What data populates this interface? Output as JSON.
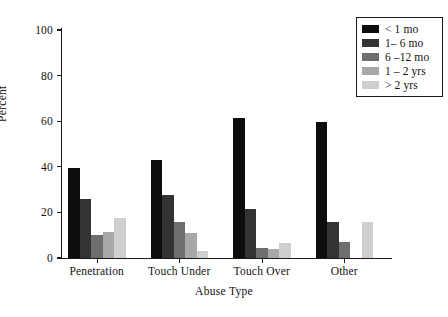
{
  "chart_data": {
    "type": "bar",
    "title": "",
    "xlabel": "Abuse Type",
    "ylabel": "Percent",
    "ylim": [
      0,
      100
    ],
    "yticks": [
      0,
      20,
      40,
      60,
      80,
      100
    ],
    "grid": false,
    "legend_position": "top-right",
    "categories": [
      "Penetration",
      "Touch Under",
      "Touch Over",
      "Other"
    ],
    "series": [
      {
        "name": "< 1 mo",
        "color": "#0d0d0d",
        "values": [
          39.5,
          43.0,
          61.5,
          59.5
        ]
      },
      {
        "name": "1– 6 mo",
        "color": "#333333",
        "values": [
          26.0,
          27.5,
          21.5,
          16.0
        ]
      },
      {
        "name": "6 –12 mo",
        "color": "#6e6e6e",
        "values": [
          10.0,
          16.0,
          4.5,
          7.0
        ]
      },
      {
        "name": "1 – 2 yrs",
        "color": "#a8a8a8",
        "values": [
          11.5,
          11.0,
          4.0,
          0.0
        ]
      },
      {
        "name": "> 2 yrs",
        "color": "#cfcfcf",
        "values": [
          17.5,
          3.0,
          6.5,
          16.0
        ]
      }
    ]
  },
  "axes": {
    "y_title": "Percent",
    "x_title": "Abuse Type",
    "y_tick_labels": [
      "0",
      "20",
      "40",
      "60",
      "80",
      "100"
    ],
    "x_tick_labels": [
      "Penetration",
      "Touch Under",
      "Touch Over",
      "Other"
    ]
  },
  "legend": {
    "items": [
      {
        "label": "< 1 mo",
        "color": "#0d0d0d"
      },
      {
        "label": "1– 6 mo",
        "color": "#333333"
      },
      {
        "label": "6 –12 mo",
        "color": "#6e6e6e"
      },
      {
        "label": "1 – 2 yrs",
        "color": "#a8a8a8"
      },
      {
        "label": "> 2 yrs",
        "color": "#cfcfcf"
      }
    ]
  }
}
